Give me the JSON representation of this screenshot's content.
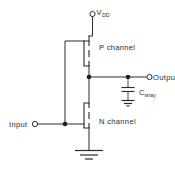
{
  "diagram": {
    "background_color": "#ffffff",
    "line_color": "#2b2b2b"
  },
  "labels": {
    "supply": "V",
    "supply_sub": "DD",
    "p_channel": "P  channel",
    "n_channel": "N  channel",
    "output": "Output",
    "input": "Input",
    "cap": "C",
    "cap_sub": "stray"
  },
  "terminals": [
    {
      "name": "vdd",
      "label": "V",
      "sublabel": "DD"
    },
    {
      "name": "input",
      "label": "Input"
    },
    {
      "name": "output",
      "label": "Output"
    }
  ],
  "components": [
    {
      "name": "p-channel-mosfet",
      "type": "mosfet",
      "channel": "P"
    },
    {
      "name": "n-channel-mosfet",
      "type": "mosfet",
      "channel": "N"
    },
    {
      "name": "stray-capacitor",
      "type": "capacitor",
      "label": "C",
      "sublabel": "stray"
    },
    {
      "name": "ground",
      "type": "ground"
    },
    {
      "name": "capacitor-ground",
      "type": "ground"
    }
  ]
}
